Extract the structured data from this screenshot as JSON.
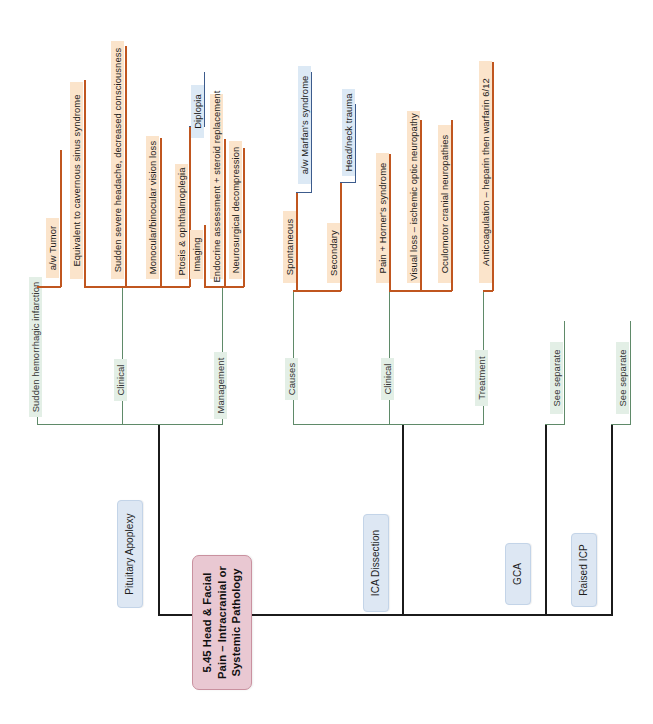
{
  "diagram": {
    "type": "mind-map",
    "orientation": "rotated-90-ccw",
    "root": {
      "label": "5.45 Head & Facial Pain – Intracranial or Systemic Pathology",
      "color": "#e9c8d2"
    },
    "colors": {
      "root_fill": "#e9c8d2",
      "topic_fill": "#dde7f3",
      "branch_fill": "#e3efe6",
      "leaf_orange_fill": "#fbe4cb",
      "leaf_blue_fill": "#dce9f5",
      "orange_line": "#c0561f",
      "green_line": "#5f8a69",
      "blue_line": "#3c5b8c",
      "trunk_line": "#1b1b1b"
    },
    "topics": [
      {
        "label": "Pituitary Apoplexy",
        "branches": [
          {
            "label": "Sudden hemorrhagic infarction",
            "leaves": [
              {
                "label": "a/w Tumor"
              }
            ]
          },
          {
            "label": "Clinical",
            "leaves": [
              {
                "label": "Equivalent to cavernous sinus syndrome"
              },
              {
                "label": "Sudden severe headache, decreased consciousness"
              },
              {
                "label": "Monocular/binocular vision loss"
              },
              {
                "label": "Ptosis & ophthalmoplegia",
                "children": [
                  {
                    "label": "Diplopia"
                  }
                ]
              }
            ]
          },
          {
            "label": "Management",
            "leaves": [
              {
                "label": "Imaging"
              },
              {
                "label": "Endocrine assessment + steroid replacement"
              },
              {
                "label": "Neurosurgical decompression"
              }
            ]
          }
        ]
      },
      {
        "label": "ICA Dissection",
        "branches": [
          {
            "label": "Causes",
            "leaves": [
              {
                "label": "Spontaneous",
                "children": [
                  {
                    "label": "a/w Marfan's syndrome"
                  }
                ]
              },
              {
                "label": "Secondary",
                "children": [
                  {
                    "label": "Head/neck trauma"
                  }
                ]
              }
            ]
          },
          {
            "label": "Clinical",
            "leaves": [
              {
                "label": "Pain + Horner's syndrome"
              },
              {
                "label": "Visual loss – ischemic optic neuropathy"
              },
              {
                "label": "Oculomotor cranial neuropathies"
              }
            ]
          },
          {
            "label": "Treatment",
            "leaves": [
              {
                "label": "Anticoagulation – heparin then warfarin 6/12"
              }
            ]
          }
        ]
      },
      {
        "label": "GCA",
        "branches": [
          {
            "label": "See separate",
            "leaves": []
          }
        ]
      },
      {
        "label": "Raised ICP",
        "branches": [
          {
            "label": "See separate",
            "leaves": []
          }
        ]
      }
    ]
  }
}
